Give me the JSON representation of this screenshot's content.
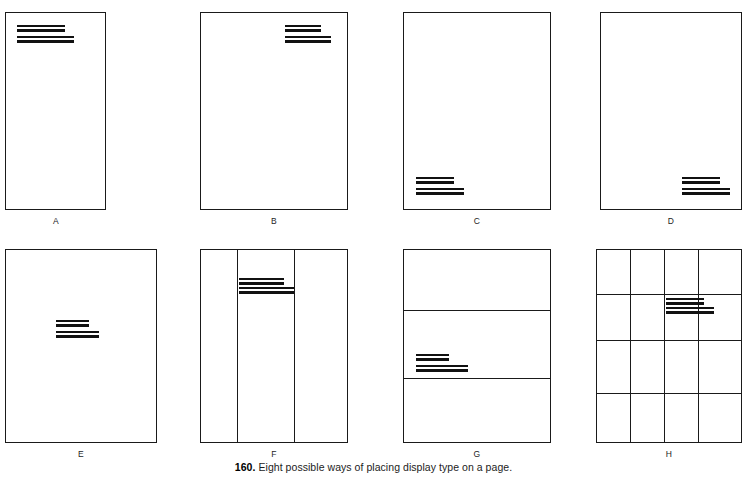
{
  "figure": {
    "caption_number": "160.",
    "caption_text": "Eight possible ways of placing display type on a page."
  },
  "panels": [
    {
      "id": "A",
      "letter": "A",
      "description": "display type at top left of page",
      "grid": "none"
    },
    {
      "id": "B",
      "letter": "B",
      "description": "display type at top right of page",
      "grid": "none"
    },
    {
      "id": "C",
      "letter": "C",
      "description": "display type at bottom left of page",
      "grid": "none"
    },
    {
      "id": "D",
      "letter": "D",
      "description": "display type at bottom right of page",
      "grid": "none"
    },
    {
      "id": "E",
      "letter": "E",
      "description": "display type centred vertically at left of page",
      "grid": "none"
    },
    {
      "id": "F",
      "letter": "F",
      "description": "display type in middle column of a three column grid",
      "grid": "three-column"
    },
    {
      "id": "G",
      "letter": "G",
      "description": "display type on lower horizontal division of a three band grid",
      "grid": "three-band"
    },
    {
      "id": "H",
      "letter": "H",
      "description": "display type in third column second row of a four by four grid",
      "grid": "four-by-four"
    }
  ],
  "colors": {
    "page_background": "#ffffff",
    "rule_stroke": "#1a1a1a",
    "type_fill": "#111111",
    "caption_text": "#1c1c1c"
  }
}
